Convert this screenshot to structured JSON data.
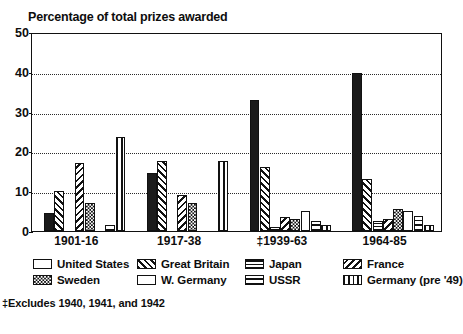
{
  "chart_data": {
    "type": "bar",
    "title": "Percentage of total prizes awarded",
    "xlabel": "",
    "ylabel": "",
    "ylim": [
      0,
      50
    ],
    "yticks": [
      0,
      10,
      20,
      30,
      40,
      50
    ],
    "grid": true,
    "gridlines_at": [
      10,
      20,
      30,
      40
    ],
    "legend_position": "below",
    "categories": [
      "1901-16",
      "1917-38",
      "‡1939-63",
      "1964-85"
    ],
    "series": [
      {
        "name": "United States",
        "pattern": "solid",
        "values": [
          4.5,
          14.5,
          33.0,
          39.8
        ]
      },
      {
        "name": "Great Britain",
        "pattern": "diag-fwd",
        "values": [
          10.0,
          17.5,
          16.0,
          13.0
        ]
      },
      {
        "name": "Japan",
        "pattern": "grid",
        "values": [
          0.0,
          0.0,
          1.0,
          2.4
        ]
      },
      {
        "name": "France",
        "pattern": "diag-back",
        "values": [
          17.0,
          9.0,
          3.5,
          3.0
        ]
      },
      {
        "name": "Sweden",
        "pattern": "check",
        "values": [
          7.0,
          7.0,
          3.0,
          5.5
        ]
      },
      {
        "name": "W. Germany",
        "pattern": "empty",
        "values": [
          0.0,
          0.0,
          5.0,
          5.0
        ]
      },
      {
        "name": "USSR",
        "pattern": "horiz",
        "values": [
          1.5,
          0.0,
          2.5,
          3.8
        ]
      },
      {
        "name": "Germany (pre '49)",
        "pattern": "vert",
        "values": [
          23.5,
          17.5,
          1.5,
          1.5
        ]
      }
    ]
  },
  "title": {
    "text": "Percentage of total prizes awarded"
  },
  "y_axis": {
    "ticks": [
      "50",
      "40",
      "30",
      "20",
      "10",
      "0"
    ]
  },
  "x_axis": {
    "labels": [
      "1901-16",
      "1917-38",
      "‡1939-63",
      "1964-85"
    ]
  },
  "legend": {
    "items": [
      {
        "label": "United States",
        "swatch": "solid-swatch-icon"
      },
      {
        "label": "Great Britain",
        "swatch": "diagonal-forward-swatch-icon"
      },
      {
        "label": "Japan",
        "swatch": "grid-swatch-icon"
      },
      {
        "label": "France",
        "swatch": "diagonal-back-swatch-icon"
      },
      {
        "label": "Sweden",
        "swatch": "checker-swatch-icon"
      },
      {
        "label": "W. Germany",
        "swatch": "empty-swatch-icon"
      },
      {
        "label": "USSR",
        "swatch": "horizontal-swatch-icon"
      },
      {
        "label": "Germany (pre '49)",
        "swatch": "vertical-swatch-icon"
      }
    ]
  },
  "footnote": {
    "text": "‡Excludes 1940, 1941, and 1942"
  }
}
